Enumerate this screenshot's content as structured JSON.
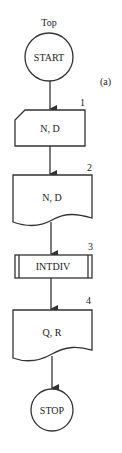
{
  "diagram": {
    "type": "flowchart",
    "caption": "(a)",
    "entry_label": "Top",
    "nodes": [
      {
        "id": "start",
        "shape": "terminal",
        "label": "START"
      },
      {
        "id": "1",
        "shape": "punched-card",
        "label": "N, D",
        "number": "1"
      },
      {
        "id": "2",
        "shape": "document",
        "label": "N, D",
        "number": "2"
      },
      {
        "id": "3",
        "shape": "predefined-process",
        "label": "INTDIV",
        "number": "3"
      },
      {
        "id": "4",
        "shape": "document",
        "label": "Q, R",
        "number": "4"
      },
      {
        "id": "stop",
        "shape": "terminal",
        "label": "STOP"
      }
    ],
    "edges": [
      [
        "start",
        "1"
      ],
      [
        "1",
        "2"
      ],
      [
        "2",
        "3"
      ],
      [
        "3",
        "4"
      ],
      [
        "4",
        "stop"
      ]
    ],
    "colors": {
      "stroke": "#333333",
      "fill": "#ffffff",
      "text": "#222222"
    }
  }
}
